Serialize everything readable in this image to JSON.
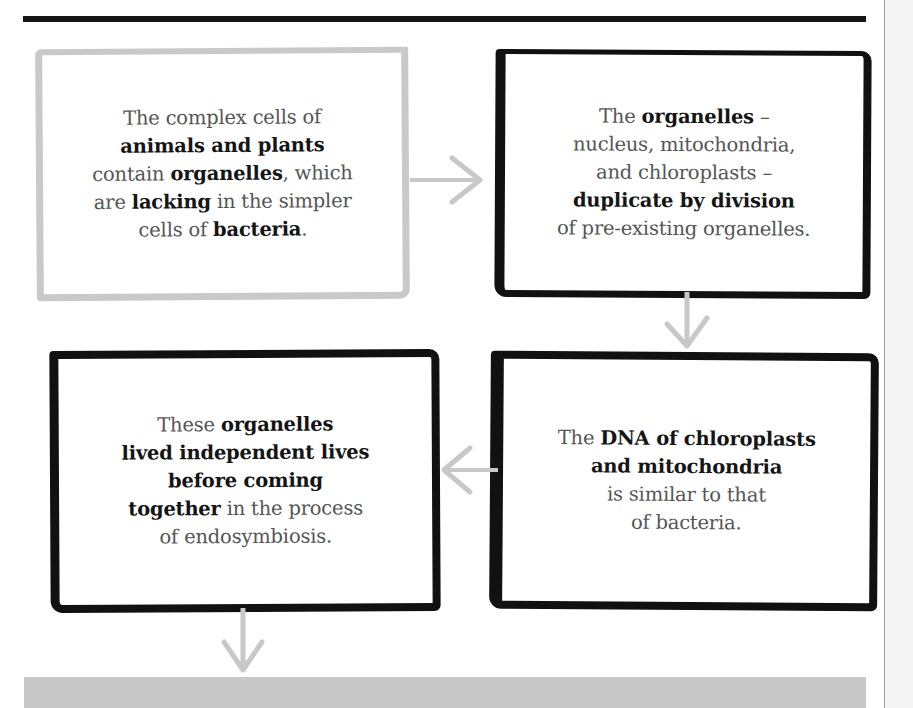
{
  "diagram": {
    "boxes": [
      {
        "id": "box1",
        "style": "light-gray-border",
        "lines": [
          [
            {
              "t": "The complex cells of",
              "b": false
            }
          ],
          [
            {
              "t": "animals and plants",
              "b": true
            }
          ],
          [
            {
              "t": "contain ",
              "b": false
            },
            {
              "t": "organelles",
              "b": true
            },
            {
              "t": ", which",
              "b": false
            }
          ],
          [
            {
              "t": "are ",
              "b": false
            },
            {
              "t": "lacking",
              "b": true
            },
            {
              "t": " in the simpler",
              "b": false
            }
          ],
          [
            {
              "t": "cells of ",
              "b": false
            },
            {
              "t": "bacteria",
              "b": true
            },
            {
              "t": ".",
              "b": false
            }
          ]
        ]
      },
      {
        "id": "box2",
        "style": "black-border",
        "lines": [
          [
            {
              "t": "The ",
              "b": false
            },
            {
              "t": "organelles",
              "b": true
            },
            {
              "t": "  –",
              "b": false
            }
          ],
          [
            {
              "t": "nucleus, mitochondria,",
              "b": false
            }
          ],
          [
            {
              "t": "and chloroplasts –",
              "b": false
            }
          ],
          [
            {
              "t": "duplicate by division",
              "b": true
            }
          ],
          [
            {
              "t": "of pre-existing organelles.",
              "b": false
            }
          ]
        ]
      },
      {
        "id": "box3",
        "style": "black-border",
        "lines": [
          [
            {
              "t": "These ",
              "b": false
            },
            {
              "t": "organelles",
              "b": true
            }
          ],
          [
            {
              "t": "lived independent lives",
              "b": true
            }
          ],
          [
            {
              "t": "before coming",
              "b": true
            }
          ],
          [
            {
              "t": "together",
              "b": true
            },
            {
              "t": " in the process",
              "b": false
            }
          ],
          [
            {
              "t": "of endosymbiosis.",
              "b": false
            }
          ]
        ]
      },
      {
        "id": "box4",
        "style": "black-border",
        "lines": [
          [
            {
              "t": "The ",
              "b": false
            },
            {
              "t": "DNA of chloroplasts",
              "b": true
            }
          ],
          [
            {
              "t": "and mitochondria",
              "b": true
            }
          ],
          [
            {
              "t": "is similar to that",
              "b": false
            }
          ],
          [
            {
              "t": "of bacteria.",
              "b": false
            }
          ]
        ]
      }
    ],
    "arrows": [
      {
        "from": "box1",
        "to": "box2",
        "direction": "right"
      },
      {
        "from": "box2",
        "to": "box4",
        "direction": "down"
      },
      {
        "from": "box4",
        "to": "box3",
        "direction": "left"
      },
      {
        "from": "box3",
        "to": "next",
        "direction": "down"
      }
    ],
    "colors": {
      "rule": "#151515",
      "light_border": "#c9c9c9",
      "dark_border": "#111111",
      "arrow": "#c8c8c8",
      "regular_text": "#555555",
      "bold_text": "#151515",
      "band": "#c8c8c8"
    }
  }
}
